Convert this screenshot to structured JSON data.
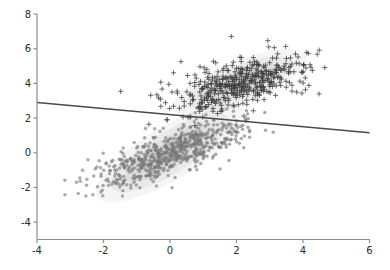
{
  "chart_data": {
    "type": "scatter",
    "title": "",
    "xlabel": "",
    "ylabel": "",
    "xlim": [
      -4,
      6
    ],
    "ylim": [
      -5,
      8
    ],
    "grid": false,
    "legend": null,
    "xticks": [
      -4,
      -2,
      0,
      2,
      4,
      6
    ],
    "yticks": [
      -4,
      -2,
      0,
      2,
      4,
      6,
      8
    ],
    "xtick_labels": [
      "-4",
      "-2",
      "0",
      "2",
      "4",
      "6"
    ],
    "ytick_labels": [
      "-4",
      "-2",
      "0",
      "2",
      "4",
      "6",
      "8"
    ],
    "colors": {
      "class0_marker": "#777777",
      "class1_marker": "#3c3c3c",
      "decision_line": "#4a4a4a",
      "density_fill": "#8c8c8c",
      "axis": "#8d8d8d",
      "tick_label": "#2b2b2b",
      "background": "#ffffff"
    },
    "annotations": [
      {
        "name": "decision-boundary",
        "type": "line",
        "x0": -4,
        "y0": 2.9,
        "x1": 6,
        "y1": 1.15
      }
    ],
    "series": [
      {
        "name": "class-0",
        "marker": "circle",
        "color": "#777777",
        "center": [
          0.0,
          0.0
        ],
        "cov": [
          [
            1.35,
            0.85
          ],
          [
            0.85,
            0.95
          ]
        ],
        "n": 620,
        "density_contours": [
          {
            "level": 1,
            "cx": 0.0,
            "cy": 0.0,
            "rx": 2.55,
            "ry": 1.55,
            "angle": -31,
            "alpha": 0.09
          },
          {
            "level": 2,
            "cx": 0.0,
            "cy": 0.0,
            "rx": 2.05,
            "ry": 1.2,
            "angle": -31,
            "alpha": 0.1
          },
          {
            "level": 3,
            "cx": 0.0,
            "cy": 0.0,
            "rx": 1.55,
            "ry": 0.88,
            "angle": -31,
            "alpha": 0.12
          },
          {
            "level": 4,
            "cx": 0.0,
            "cy": 0.0,
            "rx": 1.02,
            "ry": 0.56,
            "angle": -31,
            "alpha": 0.14
          },
          {
            "level": 5,
            "cx": 0.0,
            "cy": 0.05,
            "rx": 0.55,
            "ry": 0.3,
            "angle": -31,
            "alpha": 0.16
          }
        ]
      },
      {
        "name": "class-1",
        "marker": "plus",
        "color": "#3c3c3c",
        "center": [
          2.1,
          4.0
        ],
        "cov": [
          [
            1.15,
            0.5
          ],
          [
            0.5,
            0.72
          ]
        ],
        "n": 430,
        "density_contours": [
          {
            "level": 1,
            "cx": 2.1,
            "cy": 4.05,
            "rx": 2.15,
            "ry": 1.25,
            "angle": -22,
            "alpha": 0.09
          },
          {
            "level": 2,
            "cx": 2.1,
            "cy": 4.05,
            "rx": 1.7,
            "ry": 0.98,
            "angle": -22,
            "alpha": 0.1
          },
          {
            "level": 3,
            "cx": 2.1,
            "cy": 4.05,
            "rx": 1.25,
            "ry": 0.72,
            "angle": -22,
            "alpha": 0.12
          },
          {
            "level": 4,
            "cx": 2.1,
            "cy": 4.05,
            "rx": 0.82,
            "ry": 0.46,
            "angle": -22,
            "alpha": 0.14
          },
          {
            "level": 5,
            "cx": 2.1,
            "cy": 4.05,
            "rx": 0.42,
            "ry": 0.24,
            "angle": -22,
            "alpha": 0.16
          }
        ]
      }
    ]
  }
}
